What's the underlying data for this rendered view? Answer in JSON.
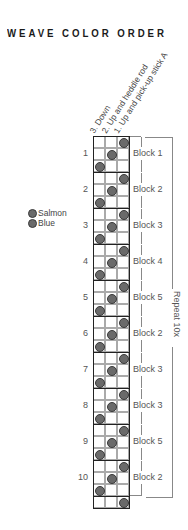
{
  "title": "WEAVE COLOR ORDER",
  "column_labels": [
    "3. Down",
    "2. Up and heddle rod",
    "1. Up and pick-up stick A"
  ],
  "legend": [
    {
      "label": "Salmon",
      "color": "#6a6a6a"
    },
    {
      "label": "Blue",
      "color": "#6a6a6a"
    }
  ],
  "blocks": [
    {
      "number": "1",
      "label": "Block 1"
    },
    {
      "number": "2",
      "label": "Block 2"
    },
    {
      "number": "3",
      "label": "Block 3"
    },
    {
      "number": "4",
      "label": "Block 4"
    },
    {
      "number": "5",
      "label": "Block 5"
    },
    {
      "number": "6",
      "label": "Block 2"
    },
    {
      "number": "7",
      "label": "Block 3"
    },
    {
      "number": "8",
      "label": "Block 3"
    },
    {
      "number": "9",
      "label": "Block 5"
    },
    {
      "number": "10",
      "label": "Block 2"
    }
  ],
  "block_pattern": [
    3,
    2,
    1
  ],
  "final_row_column": 3,
  "repeat_label": "Repeat 10x"
}
